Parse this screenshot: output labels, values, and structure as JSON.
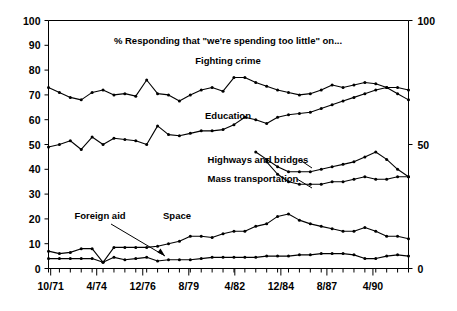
{
  "chart_data": {
    "type": "line",
    "title": "% Responding that \"we're spending too little\" on...",
    "subtitle": "Fighting crime",
    "xlabel": "",
    "ylabel": "",
    "ylim": [
      0,
      100
    ],
    "y_ticks": [
      0,
      10,
      20,
      30,
      40,
      50,
      60,
      70,
      80,
      90,
      100
    ],
    "y_ticks_right": [
      0,
      50,
      100
    ],
    "x_tick_labels": [
      "10/71",
      "4/74",
      "12/76",
      "8/79",
      "4/82",
      "12/84",
      "8/87",
      "4/90"
    ],
    "grid": false,
    "legend": "inline-annotations",
    "annotations": [
      {
        "text": "Fighting crime",
        "series": "Fighting crime"
      },
      {
        "text": "Education",
        "series": "Education"
      },
      {
        "text": "Highways and bridges",
        "series": "Highways and bridges"
      },
      {
        "text": "Mass transportation",
        "series": "Mass transportation"
      },
      {
        "text": "Space",
        "series": "Space"
      },
      {
        "text": "Foreign aid",
        "series": "Foreign aid",
        "arrow": true
      }
    ],
    "series": [
      {
        "name": "Fighting crime",
        "x": [
          0,
          1,
          2,
          3,
          4,
          5,
          6,
          7,
          8,
          9,
          10,
          11,
          12,
          13,
          14,
          15,
          16,
          17,
          18,
          19,
          20,
          21,
          22,
          23,
          24,
          25,
          26,
          27,
          28,
          29,
          30,
          31,
          32,
          33
        ],
        "values": [
          73,
          71,
          69,
          68,
          71,
          72,
          70,
          70.5,
          69.5,
          76,
          70.5,
          70,
          67.5,
          70,
          72,
          73,
          71.5,
          77,
          77,
          75,
          73.5,
          72,
          71,
          70,
          70.5,
          72,
          74,
          73,
          74,
          75,
          74.5,
          73,
          70.5,
          68
        ]
      },
      {
        "name": "Education",
        "x": [
          0,
          1,
          2,
          3,
          4,
          5,
          6,
          7,
          8,
          9,
          10,
          11,
          12,
          13,
          14,
          15,
          16,
          17,
          18,
          19,
          20,
          21,
          22,
          23,
          24,
          25,
          26,
          27,
          28,
          29,
          30,
          31,
          32,
          33
        ],
        "values": [
          49,
          50,
          51.5,
          48,
          53,
          50,
          52.5,
          52,
          51.5,
          50,
          57.5,
          54,
          53.5,
          54.5,
          55.5,
          55.5,
          56,
          58,
          61,
          60,
          58.5,
          61,
          62,
          62.5,
          63,
          64.5,
          66,
          67.5,
          69,
          70.5,
          72,
          73,
          73,
          72
        ]
      },
      {
        "name": "Highways and bridges",
        "x": [
          19,
          20,
          21,
          22,
          23,
          24,
          25,
          26,
          27,
          28,
          29,
          30,
          31,
          32,
          33
        ],
        "values": [
          47,
          44,
          41,
          39,
          39,
          39,
          40,
          41,
          42,
          43,
          45,
          47,
          44,
          40,
          37
        ]
      },
      {
        "name": "Mass transportation",
        "x": [
          20,
          21,
          22,
          23,
          24,
          25,
          26,
          27,
          28,
          29,
          30,
          31,
          32,
          33
        ],
        "values": [
          43,
          38,
          35,
          34,
          34,
          34,
          35,
          35,
          36,
          37,
          36,
          36,
          37,
          37
        ]
      },
      {
        "name": "Space",
        "x": [
          0,
          1,
          2,
          3,
          4,
          5,
          6,
          7,
          8,
          9,
          10,
          11,
          12,
          13,
          14,
          15,
          16,
          17,
          18,
          19,
          20,
          21,
          22,
          23,
          24,
          25,
          26,
          27,
          28,
          29,
          30,
          31,
          32,
          33
        ],
        "values": [
          7,
          6,
          6.5,
          8,
          8,
          2.5,
          8.5,
          8.5,
          8.5,
          8.5,
          9,
          10,
          11,
          13,
          13,
          12.5,
          14,
          15,
          15,
          17,
          18,
          21,
          22,
          19.5,
          18,
          17,
          16,
          15,
          15,
          16.5,
          15,
          13,
          13,
          12
        ]
      },
      {
        "name": "Foreign aid",
        "x": [
          0,
          1,
          2,
          3,
          4,
          5,
          6,
          7,
          8,
          9,
          10,
          11,
          12,
          13,
          14,
          15,
          16,
          17,
          18,
          19,
          20,
          21,
          22,
          23,
          24,
          25,
          26,
          27,
          28,
          29,
          30,
          31,
          32,
          33
        ],
        "values": [
          4,
          4,
          4,
          4,
          4,
          2.5,
          4.5,
          3.5,
          4,
          4.5,
          3,
          3.5,
          3.5,
          3.5,
          4,
          4.5,
          4.5,
          4.5,
          4.5,
          4.5,
          5,
          5,
          5,
          5.5,
          5.5,
          6,
          6,
          6,
          5.5,
          4,
          4,
          5,
          5.5,
          5
        ]
      }
    ]
  },
  "axes": {
    "left_title": "",
    "right_title": ""
  }
}
